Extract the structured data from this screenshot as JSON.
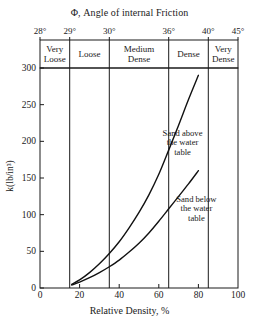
{
  "chart_data": {
    "type": "line",
    "title": "Φ, Angle of internal Friction",
    "xlabel": "Relative Density, %",
    "ylabel": "k(lb/in³)",
    "xlim": [
      0,
      100
    ],
    "ylim": [
      0,
      300
    ],
    "grid": false,
    "x_ticks": [
      0,
      20,
      40,
      60,
      80,
      100
    ],
    "y_ticks": [
      0,
      50,
      100,
      150,
      200,
      250,
      300
    ],
    "top_axis": {
      "label": "Φ, Angle of internal Friction",
      "ticks": [
        {
          "value": 0,
          "label": "28°"
        },
        {
          "value": 15,
          "label": "29°"
        },
        {
          "value": 35,
          "label": "30°"
        },
        {
          "value": 65,
          "label": "36°"
        },
        {
          "value": 85,
          "label": "40°"
        },
        {
          "value": 100,
          "label": "45°"
        }
      ]
    },
    "bands": [
      {
        "label": "Very\nLoose",
        "start": 0,
        "end": 15
      },
      {
        "label": "Loose",
        "start": 15,
        "end": 35
      },
      {
        "label": "Medium\nDense",
        "start": 35,
        "end": 65
      },
      {
        "label": "Dense",
        "start": 65,
        "end": 85
      },
      {
        "label": "Very\nDense",
        "start": 85,
        "end": 100
      }
    ],
    "band_dividers": [
      15,
      35,
      65,
      85
    ],
    "series": [
      {
        "name": "Sand above the water table",
        "annotation": "Sand above\nthe water\ntable",
        "annotation_x": 72,
        "annotation_y": 198,
        "x": [
          16,
          20,
          25,
          30,
          35,
          40,
          45,
          50,
          55,
          60,
          65,
          70,
          75,
          80
        ],
        "y": [
          5,
          11,
          21,
          33,
          47,
          63,
          82,
          103,
          127,
          155,
          188,
          222,
          257,
          290
        ]
      },
      {
        "name": "Sand below the water table",
        "annotation": "Sand below\nthe water\ntable",
        "annotation_x": 79,
        "annotation_y": 108,
        "x": [
          16,
          20,
          25,
          30,
          35,
          40,
          45,
          50,
          55,
          60,
          65,
          70,
          75,
          80
        ],
        "y": [
          4,
          8,
          14,
          21,
          29,
          38,
          49,
          61,
          75,
          91,
          108,
          125,
          142,
          160
        ]
      }
    ]
  },
  "colors": {
    "axis": "#1a1a1a",
    "curve": "#111111",
    "background": "#ffffff"
  }
}
